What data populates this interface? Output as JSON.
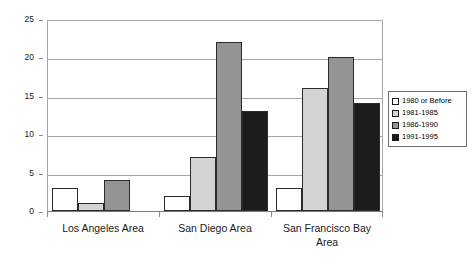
{
  "chart_data": {
    "type": "bar",
    "title": "",
    "subtitle": "",
    "xlabel": "",
    "ylabel": "",
    "ylim": [
      0,
      25
    ],
    "yticks": [
      0,
      5,
      10,
      15,
      20,
      25
    ],
    "grid": true,
    "legend_position": "right",
    "categories": [
      "Los Angeles Area",
      "San Diego Area",
      "San Francisco Bay Area"
    ],
    "series": [
      {
        "name": "1980 or Before",
        "color": "#ffffff",
        "values": [
          3,
          2,
          3
        ]
      },
      {
        "name": "1981-1985",
        "color": "#d4d4d4",
        "values": [
          1,
          7,
          16
        ]
      },
      {
        "name": "1986-1990",
        "color": "#949494",
        "values": [
          4,
          22,
          20
        ]
      },
      {
        "name": "1991-1995",
        "color": "#1c1c1c",
        "values": [
          0,
          13,
          14
        ]
      }
    ]
  },
  "legend": {
    "entries": [
      {
        "label": "1980 or Before"
      },
      {
        "label": "1981-1985"
      },
      {
        "label": "1986-1990"
      },
      {
        "label": "1991-1995"
      }
    ]
  },
  "axis": {
    "y_tick_labels": [
      "0",
      "5",
      "10",
      "15",
      "20",
      "25"
    ],
    "x_tick_labels": [
      "Los Angeles Area",
      "San Diego Area",
      "San Francisco Bay Area"
    ]
  }
}
